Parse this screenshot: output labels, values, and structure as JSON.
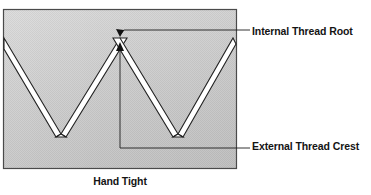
{
  "figure": {
    "caption": "Hand Tight",
    "top_partial_text": "",
    "annotations": [
      {
        "id": "internal-thread-root",
        "label": "Internal Thread Root",
        "target_x": 120,
        "target_y": 34,
        "leader_y": 30,
        "text_x": 252,
        "text_y": 25
      },
      {
        "id": "external-thread-crest",
        "label": "External Thread Crest",
        "target_x": 120,
        "target_y": 46,
        "leader_y": 148,
        "text_x": 252,
        "text_y": 140
      }
    ],
    "colors": {
      "body_fill": "#c9c9c9",
      "body_fill_light": "#d6d6d6",
      "body_fill_dark": "#bdbdbd",
      "outline": "#3a3a3a",
      "channel_fill": "#ffffff",
      "channel_outline": "#2b2b2b",
      "leader_line": "#1e1e1e",
      "text": "#141414",
      "page_background": "#ffffff"
    },
    "box": {
      "x": 3,
      "y": 9,
      "width": 234,
      "height": 160
    },
    "thread_profile": {
      "description": "Cross-section of mating internal and external screw threads at hand-tight condition",
      "crest_y": 38,
      "root_y": 135,
      "peaks_x": [
        3,
        120,
        233
      ],
      "valleys_x": [
        61,
        178
      ],
      "channel_width": 7
    }
  }
}
